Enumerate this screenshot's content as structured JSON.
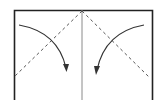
{
  "diagram": {
    "type": "origami-fold-diagram",
    "colors": {
      "paper_edge": "#222222",
      "center_crease": "#8a8a8a",
      "fold_line": "#555555",
      "arrow": "#333333",
      "background": "#ffffff"
    },
    "elements": {
      "paper_outline": "paper-edge",
      "center_line": "center-crease",
      "left_fold": "valley-fold-left",
      "right_fold": "valley-fold-right",
      "left_arrow": "fold-arrow-left",
      "right_arrow": "fold-arrow-right"
    }
  }
}
